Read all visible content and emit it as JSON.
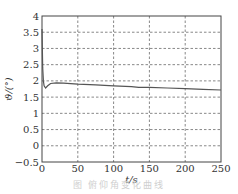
{
  "chart_data": {
    "type": "line",
    "title": "",
    "xlabel": "t/s",
    "ylabel": "ϑ/(°)",
    "xlim": [
      0,
      250
    ],
    "ylim": [
      -0.5,
      4
    ],
    "xticks": [
      0,
      50,
      100,
      150,
      200,
      250
    ],
    "yticks": [
      -0.5,
      0,
      0.5,
      1,
      1.5,
      2,
      2.5,
      3,
      3.5,
      4
    ],
    "xtick_labels": [
      "0",
      "50",
      "100",
      "150",
      "200",
      "250"
    ],
    "ytick_labels": [
      "−0.5",
      "0",
      "0.5",
      "1",
      "1.5",
      "2",
      "2.5",
      "3",
      "3.5",
      "4"
    ],
    "grid": true,
    "grid_style": "dashed",
    "legend": null,
    "series": [
      {
        "name": "ϑ",
        "color": "#555555",
        "x": [
          0,
          1,
          2,
          3,
          5,
          8,
          12,
          20,
          30,
          50,
          75,
          100,
          125,
          135,
          150,
          175,
          200,
          225,
          250
        ],
        "values": [
          3.6,
          2.4,
          2.0,
          1.85,
          1.78,
          1.85,
          1.92,
          1.94,
          1.93,
          1.9,
          1.88,
          1.85,
          1.82,
          1.8,
          1.8,
          1.78,
          1.76,
          1.74,
          1.72
        ]
      }
    ]
  },
  "caption": "图    俯仰角变化曲线"
}
